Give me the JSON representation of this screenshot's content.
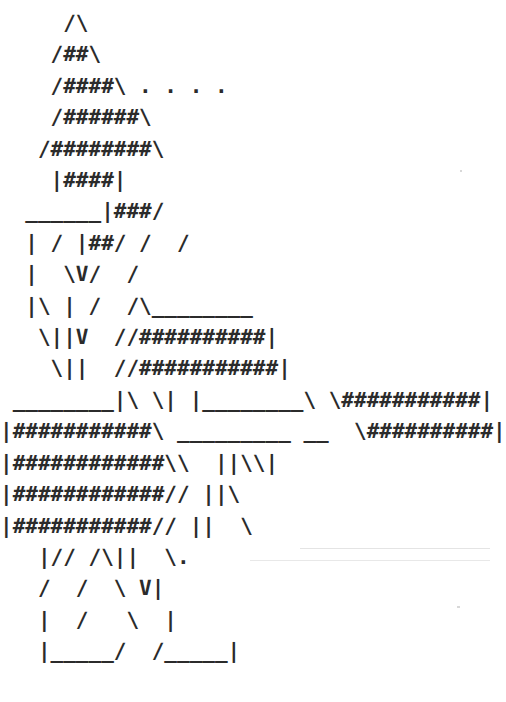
{
  "canvas": {
    "width": 493,
    "height": 702,
    "background_color": "#ffffff",
    "ink_color": "#2b2b2b",
    "medium": "ascii-art",
    "char_cell_width_px": 12.6,
    "line_height_px": 31.4,
    "font_size_px": 21,
    "columns": 38,
    "rows": 21
  },
  "art": {
    "title": "ascii-art-figure",
    "description": "Monospace ASCII art of a tall hash-filled figure with a pointed peak, tapering torso, outstretched banded arms, and two legs ending in bracket-shaped feet.",
    "line_count": 21,
    "lines": [
      "     /\\",
      "    /##\\",
      "    /####\\ . . . .",
      "    /######\\",
      "   /########\\",
      "    |####|",
      "  ______|###/",
      "  | / |##/ /  /",
      "  |  \\V/  /",
      "  |\\ | /  /\\________",
      "   \\||V  //##########|",
      "    \\||  //###########|",
      " ________|\\ \\| |________\\ \\###########|",
      "|###########\\ _________ __  \\##########|",
      "|############\\\\  ||\\\\|",
      "|############// ||\\",
      "|###########// ||  \\",
      "   |// /\\||  \\.",
      "   /  /  \\ V|",
      "   |  /   \\  |",
      "   |_____/  /_____|"
    ],
    "raw_text": "     /\\\n    /##\\\n    /####\\ . . . .\n    /######\\\n   /########\\\n    |####|\n  ______|###/\n  | / |##/ /  /\n  |  \\V/  /\n  |\\ | /  /\\________\n   \\||V  //##########|\n    \\||  //###########|\n ________|\\ \\| |________\\ \\###########|\n|###########\\ _________ __  \\##########|\n|############\\\\  ||\\\\|\n|############// ||\\\n|###########// ||  \\\n   |// /\\||  \\.\n   /  /  \\ V|\n   |  /   \\  |\n   |_____/  /_____|",
    "glyphs_used": [
      "/",
      "\\",
      "|",
      "#",
      "_",
      "V",
      ".",
      " "
    ]
  },
  "artifacts": [
    {
      "name": "scan-speck-upper-right",
      "x": 460,
      "y": 170,
      "w": 2,
      "h": 2
    },
    {
      "name": "scan-speck-lower-right",
      "x": 457,
      "y": 606,
      "w": 3,
      "h": 2
    },
    {
      "name": "scan-streak-mid",
      "x": 300,
      "y": 548,
      "w": 190,
      "h": 1
    },
    {
      "name": "scan-streak-low",
      "x": 250,
      "y": 560,
      "w": 240,
      "h": 1
    }
  ]
}
